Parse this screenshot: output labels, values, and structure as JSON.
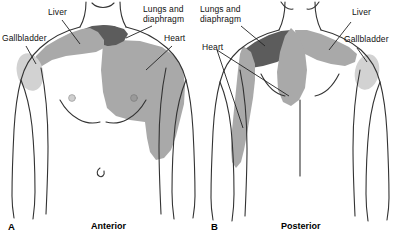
{
  "figure": {
    "width": 398,
    "height": 238,
    "background": "#ffffff"
  },
  "colors": {
    "light_gray": "#d2d2d2",
    "medium_gray": "#a9a9a9",
    "dark_gray": "#5c5c5c",
    "outline": "#333333",
    "text": "#111111",
    "leader_line": "#222222"
  },
  "legend_regions": [
    {
      "key": "gallbladder",
      "label": "Gallbladder",
      "shade": "light_gray"
    },
    {
      "key": "liver",
      "label": "Liver",
      "shade": "medium_gray"
    },
    {
      "key": "lungs_diaphragm",
      "label": "Lungs and diaphragm",
      "shade": "dark_gray"
    },
    {
      "key": "heart",
      "label": "Heart",
      "shade": "medium_gray"
    }
  ],
  "panels": [
    {
      "id": "anterior",
      "caption_letter": "A",
      "caption": "Anterior",
      "labels": [
        {
          "name": "gallbladder",
          "text": "Gallbladder",
          "x": 2,
          "y": 38
        },
        {
          "name": "liver",
          "text": "Liver",
          "x": 48,
          "y": 7
        },
        {
          "name": "lungs-diaphragm",
          "line1": "Lungs and",
          "line2": "diaphragm",
          "x": 144,
          "y": 5
        },
        {
          "name": "heart",
          "text": "Heart",
          "x": 163,
          "y": 34
        }
      ],
      "shaded_regions": [
        {
          "name": "gallbladder-patch",
          "shade": "light_gray"
        },
        {
          "name": "liver-patch",
          "shade": "medium_gray"
        },
        {
          "name": "lungs-diaphragm-patch",
          "shade": "dark_gray"
        },
        {
          "name": "heart-patch",
          "shade": "medium_gray"
        }
      ]
    },
    {
      "id": "posterior",
      "caption_letter": "B",
      "caption": "Posterior",
      "labels": [
        {
          "name": "lungs-diaphragm",
          "line1": "Lungs and",
          "line2": "diaphragm",
          "x": 200,
          "y": 5
        },
        {
          "name": "heart",
          "text": "Heart",
          "x": 202,
          "y": 44
        },
        {
          "name": "liver",
          "text": "Liver",
          "x": 352,
          "y": 8
        },
        {
          "name": "gallbladder",
          "text": "Gallbladder",
          "x": 344,
          "y": 36
        }
      ],
      "shaded_regions": [
        {
          "name": "lungs-diaphragm-patch",
          "shade": "dark_gray"
        },
        {
          "name": "liver-patch",
          "shade": "medium_gray"
        },
        {
          "name": "gallbladder-patch",
          "shade": "light_gray"
        },
        {
          "name": "heart-scapular-patch",
          "shade": "medium_gray"
        },
        {
          "name": "heart-flank-patch",
          "shade": "medium_gray"
        }
      ]
    }
  ],
  "captions": {
    "panel_a_letter": "A",
    "panel_a_text": "Anterior",
    "panel_b_letter": "B",
    "panel_b_text": "Posterior"
  }
}
